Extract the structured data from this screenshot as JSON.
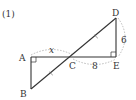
{
  "problem": {
    "number_label": "(1)"
  },
  "points": {
    "A": {
      "label": "A",
      "x": 31,
      "y": 57
    },
    "B": {
      "label": "B",
      "x": 31,
      "y": 89
    },
    "C": {
      "label": "C",
      "x": 73,
      "y": 57
    },
    "D": {
      "label": "D",
      "x": 116,
      "y": 18
    },
    "E": {
      "label": "E",
      "x": 116,
      "y": 57
    }
  },
  "measures": {
    "AC": "x",
    "CE": "8",
    "DE": "6"
  },
  "colors": {
    "line": "#333333",
    "dotted": "#aaaaaa"
  }
}
